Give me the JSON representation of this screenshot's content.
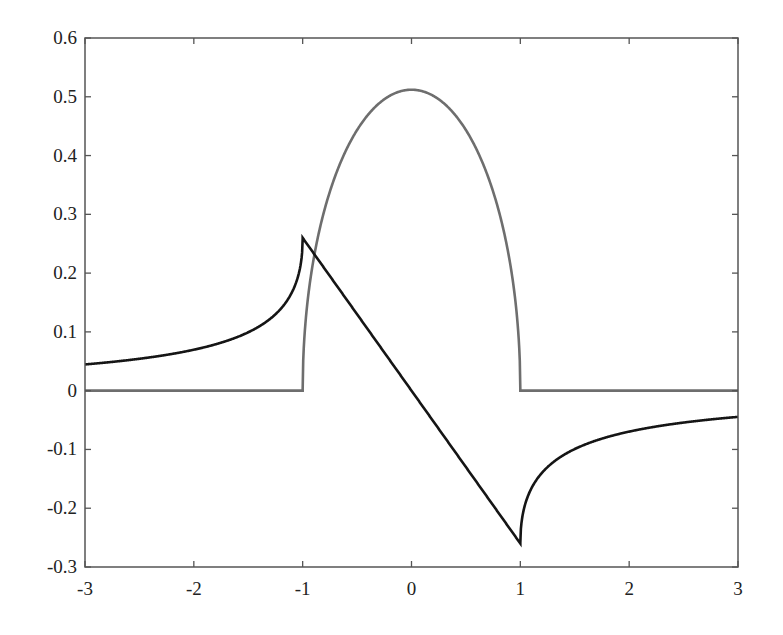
{
  "chart_data": {
    "type": "line",
    "title": "",
    "xlabel": "",
    "ylabel": "",
    "xlim": [
      -3,
      3
    ],
    "ylim": [
      -0.3,
      0.6
    ],
    "grid": false,
    "legend": null,
    "xticks": [
      -3,
      -2,
      -1,
      0,
      1,
      2,
      3
    ],
    "xtick_labels": [
      "-3",
      "-2",
      "-1",
      "0",
      "1",
      "2",
      "3"
    ],
    "yticks": [
      -0.3,
      -0.2,
      -0.1,
      0,
      0.1,
      0.2,
      0.3,
      0.4,
      0.5,
      0.6
    ],
    "ytick_labels": [
      "-0.3",
      "-0.2",
      "-0.1",
      "0",
      "0.1",
      "0.2",
      "0.3",
      "0.4",
      "0.5",
      "0.6"
    ],
    "series": [
      {
        "name": "gray curve (semicircle density)",
        "color": "#6e6e6e",
        "description": "0 for |x|>1, approx 0.512*sqrt(1-x^2) for |x|<=1",
        "x": [
          -3,
          -1,
          -0.9,
          -0.75,
          -0.5,
          -0.25,
          0,
          0.25,
          0.5,
          0.75,
          0.9,
          1,
          3
        ],
        "y": [
          0,
          0,
          0.223,
          0.339,
          0.443,
          0.496,
          0.512,
          0.496,
          0.443,
          0.339,
          0.223,
          0,
          0
        ]
      },
      {
        "name": "black curve (Hilbert transform)",
        "color": "#151515",
        "description": "-0.26*x for |x|<=1, -0.26*(x - sign(x)*sqrt(x^2-1)) for |x|>1",
        "x": [
          -3,
          -2.5,
          -2,
          -1.5,
          -1.2,
          -1,
          -0.5,
          0,
          0.5,
          1,
          1.2,
          1.5,
          2,
          2.5,
          3
        ],
        "y": [
          0.045,
          0.054,
          0.07,
          0.1,
          0.14,
          0.26,
          0.13,
          0,
          -0.13,
          -0.26,
          -0.14,
          -0.1,
          -0.07,
          -0.054,
          -0.045
        ]
      }
    ]
  },
  "plot": {
    "box": {
      "left": 85,
      "right": 738,
      "top": 38,
      "bottom": 567
    },
    "axis_color": "#555555"
  }
}
